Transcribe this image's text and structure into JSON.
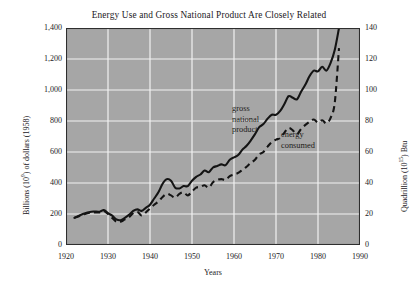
{
  "chart_data": {
    "type": "line",
    "title": "Energy Use and Gross National Product Are Closely Related",
    "xlabel": "Years",
    "ylabel": "Billions (10⁹) of dollars (1958)",
    "ylabel_right": "Quadrillion (10¹⁵) Btu",
    "xlim": [
      1920,
      1990
    ],
    "ylim": [
      0,
      1400
    ],
    "ylim_right": [
      0,
      140
    ],
    "grid": true,
    "legend_position": "inline-annotations",
    "plot_background": "#a6a6a6",
    "gridline_color": "#f2f2f2",
    "line_color": "#1a1a1a",
    "xticks": [
      1920,
      1930,
      1940,
      1950,
      1960,
      1970,
      1980,
      1990
    ],
    "xtick_labels": [
      "1920",
      "1930",
      "1940",
      "1950",
      "1960",
      "1970",
      "1980",
      "1990"
    ],
    "yticks": [
      0,
      200,
      400,
      600,
      800,
      1000,
      1200,
      1400
    ],
    "ytick_labels": [
      "0",
      "200",
      "400",
      "600",
      "800",
      "1,000",
      "1,200",
      "1,400"
    ],
    "yticks_right": [
      0,
      20,
      40,
      60,
      80,
      100,
      120,
      140
    ],
    "ytick_labels_right": [
      "0",
      "20",
      "40",
      "60",
      "80",
      "100",
      "120",
      "140"
    ],
    "annotations": [
      {
        "text_lines": [
          "gross",
          "national",
          "product"
        ],
        "series": "gross national product",
        "style": "solid"
      },
      {
        "text_lines": [
          "energy",
          "consumed"
        ],
        "series": "energy consumed",
        "style": "dashed"
      }
    ],
    "series": [
      {
        "name": "gross national product",
        "style": "solid",
        "axis": "left",
        "units": "Billions (10^9) of 1958 dollars",
        "x": [
          1922,
          1924,
          1926,
          1928,
          1929,
          1930,
          1931,
          1932,
          1933,
          1934,
          1935,
          1936,
          1937,
          1938,
          1939,
          1940,
          1941,
          1942,
          1943,
          1944,
          1945,
          1946,
          1947,
          1948,
          1949,
          1950,
          1951,
          1952,
          1953,
          1954,
          1955,
          1956,
          1957,
          1958,
          1959,
          1960,
          1961,
          1962,
          1963,
          1964,
          1965,
          1966,
          1967,
          1968,
          1969,
          1970,
          1971,
          1972,
          1973,
          1974,
          1975,
          1976,
          1977,
          1978,
          1979,
          1980,
          1981,
          1982,
          1983,
          1984,
          1985
        ],
        "values": [
          175,
          200,
          215,
          215,
          225,
          205,
          190,
          165,
          160,
          175,
          195,
          220,
          230,
          220,
          240,
          260,
          300,
          340,
          395,
          425,
          415,
          370,
          365,
          380,
          380,
          415,
          440,
          455,
          480,
          470,
          500,
          510,
          520,
          515,
          550,
          565,
          580,
          615,
          640,
          675,
          715,
          760,
          780,
          815,
          840,
          840,
          865,
          910,
          960,
          950,
          940,
          990,
          1035,
          1090,
          1125,
          1120,
          1150,
          1125,
          1175,
          1260,
          1400
        ],
        "final_value": 1400
      },
      {
        "name": "energy consumed",
        "style": "dashed",
        "axis": "right",
        "units": "Quadrillion (10^15) Btu",
        "x": [
          1922,
          1924,
          1926,
          1928,
          1929,
          1930,
          1931,
          1932,
          1933,
          1934,
          1935,
          1936,
          1937,
          1938,
          1939,
          1940,
          1941,
          1942,
          1943,
          1944,
          1945,
          1946,
          1947,
          1948,
          1949,
          1950,
          1951,
          1952,
          1953,
          1954,
          1955,
          1956,
          1957,
          1958,
          1959,
          1960,
          1961,
          1962,
          1963,
          1964,
          1965,
          1966,
          1967,
          1968,
          1969,
          1970,
          1971,
          1972,
          1973,
          1974,
          1975,
          1976,
          1977,
          1978,
          1979,
          1980,
          1981,
          1982,
          1983,
          1984,
          1985
        ],
        "values": [
          17.5,
          19.5,
          21.0,
          21.0,
          22.0,
          20.0,
          17.5,
          15.0,
          15.0,
          16.5,
          18.0,
          20.5,
          21.5,
          19.0,
          21.0,
          23.5,
          26.0,
          28.0,
          31.0,
          33.0,
          32.0,
          30.5,
          33.0,
          34.0,
          32.0,
          34.5,
          37.0,
          37.5,
          38.5,
          37.0,
          40.5,
          42.0,
          42.5,
          42.0,
          44.5,
          45.5,
          46.5,
          48.5,
          50.5,
          53.0,
          55.0,
          58.5,
          60.0,
          63.5,
          66.5,
          68.0,
          69.0,
          72.5,
          75.5,
          74.0,
          71.5,
          75.0,
          77.5,
          79.5,
          81.0,
          79.0,
          80.5,
          78.5,
          82.0,
          92.0,
          127.0
        ],
        "final_value": 127
      }
    ]
  },
  "figure": {
    "annot_gnp_line1": "gross",
    "annot_gnp_line2": "national",
    "annot_gnp_line3": "product",
    "annot_energy_line1": "energy",
    "annot_energy_line2": "consumed"
  }
}
